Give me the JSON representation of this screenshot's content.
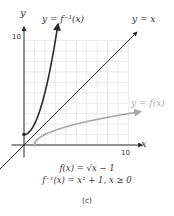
{
  "chart_data": {
    "type": "line",
    "panel_label": "(c)",
    "xlabel": "x",
    "ylabel": "y",
    "xlim": [
      0,
      10
    ],
    "ylim": [
      0,
      10
    ],
    "x_tick_labels": [
      "10"
    ],
    "y_tick_labels": [
      "10"
    ],
    "grid": true,
    "grid_step": 1,
    "series": [
      {
        "name": "y = f⁻¹(x)",
        "formula": "x^2 + 1, x >= 0",
        "color": "#2b2b2b",
        "x": [
          0,
          0.5,
          1,
          1.5,
          2,
          2.5,
          3,
          3.2
        ],
        "y": [
          1,
          1.25,
          2,
          3.25,
          5,
          7.25,
          10,
          11.24
        ]
      },
      {
        "name": "y = x",
        "color": "#2b2b2b",
        "x": [
          -2.3,
          10.8
        ],
        "y": [
          -2.3,
          10.8
        ]
      },
      {
        "name": "y = f(x)",
        "formula": "sqrt(x - 1)",
        "color": "#a8a8a8",
        "x": [
          1,
          1.25,
          2,
          3,
          5,
          7,
          9,
          10,
          11.2
        ],
        "y": [
          0,
          0.5,
          1,
          1.41,
          2,
          2.45,
          2.83,
          3,
          3.19
        ]
      }
    ],
    "annotations": [
      "y = f⁻¹(x)",
      "y = x",
      "y = f(x)"
    ]
  },
  "labels": {
    "y_axis": "y",
    "x_axis": "x",
    "y_tick_10": "10",
    "x_tick_10": "10",
    "finv_label": "y = f⁻¹(x)",
    "identity_label": "y = x",
    "f_label": "y = f(x)"
  },
  "caption": {
    "line1": "f(x) = √x − 1",
    "line2": "f⁻¹(x) = x² + 1, x ≥ 0",
    "panel": "(c)"
  },
  "colors": {
    "dark_curve": "#2b2b2b",
    "light_curve": "#a8a8a8",
    "grid": "#e4e4e4",
    "axis": "#2b2b2b"
  }
}
